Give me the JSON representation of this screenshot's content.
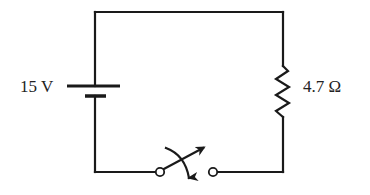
{
  "diagram": {
    "type": "circuit",
    "components": {
      "battery": {
        "label": "15 V",
        "symbol": "battery-icon"
      },
      "resistor": {
        "label": "4.7 Ω",
        "symbol": "resistor-icon"
      },
      "switch": {
        "state": "open",
        "symbol": "switch-icon"
      }
    },
    "colors": {
      "line": "#1a1a1a",
      "text": "#222222",
      "background": "#ffffff"
    }
  }
}
